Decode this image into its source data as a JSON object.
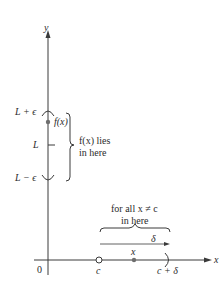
{
  "diagram": {
    "colors": {
      "axis": "#3a3a3a",
      "text": "#2b2b2b",
      "point": "#6e6e6e",
      "background": "#ffffff"
    },
    "axes": {
      "y_label": "y",
      "x_label": "x",
      "origin_label": "0"
    },
    "y_axis_marks": {
      "upper": "L + ϵ",
      "center": "L",
      "lower": "L − ϵ",
      "point_label": "f(x)"
    },
    "y_brace_text": {
      "line1": "f(x) lies",
      "line2": "in here"
    },
    "x_axis_marks": {
      "c": "c",
      "x": "x",
      "c_plus_delta": "c + δ"
    },
    "x_brace_text": {
      "line1": "for all x ≠ c",
      "line2": "in here"
    },
    "delta_label": "δ"
  }
}
